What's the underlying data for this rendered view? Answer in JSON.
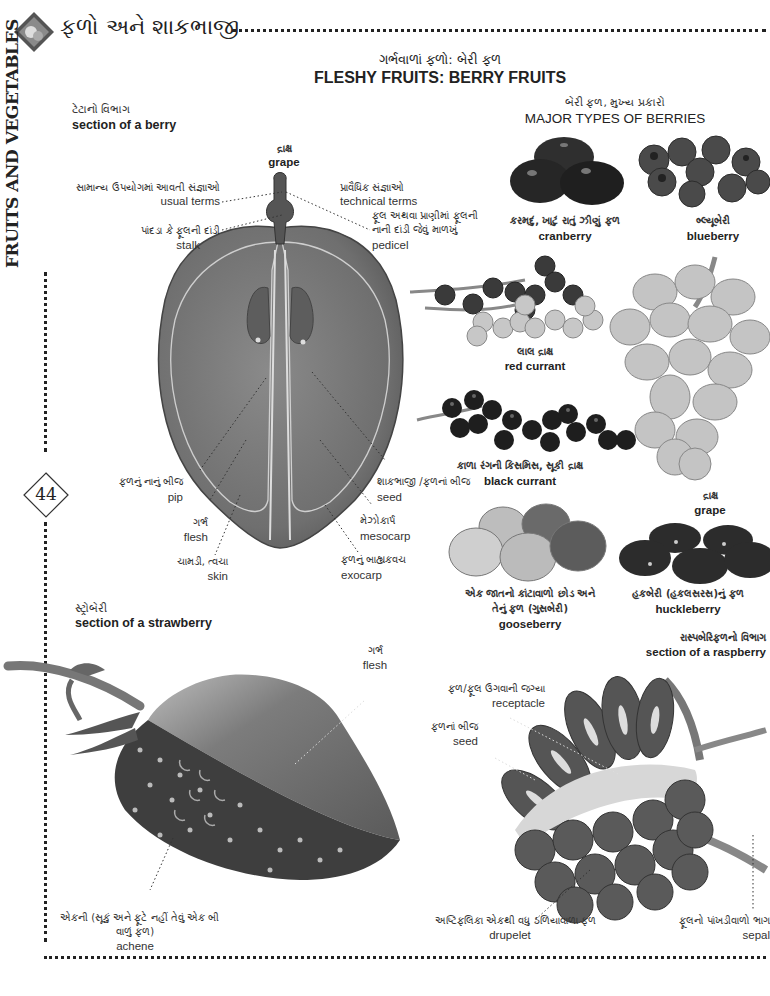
{
  "header": {
    "title_gu": "ફળો અને શાકભાજી",
    "vertical_title": "FRUITS AND VEGETABLES",
    "page_number": "44",
    "heading_gu": "ગર્ભવાળાં ફળો: બેરી ફળ",
    "heading_en": "FLESHY FRUITS: BERRY FRUITS"
  },
  "berry_section": {
    "title_gu": "ટેટાનો વિભાગ",
    "title_en": "section of a berry",
    "fruit_gu": "દ્રાક્ષ",
    "fruit_en": "grape",
    "labels": {
      "usual_gu": "સામાન્ય ઉપયોગમાં આવતી સંજ્ઞાઓ",
      "usual_en": "usual terms",
      "technical_gu": "પ્રાવૈધિક સંજ્ઞાઓ",
      "technical_en": "technical terms",
      "stalk_gu": "પાંદડા કે ફૂલની દાંડી",
      "stalk_en": "stalk",
      "pedicel_gu_1": "ફૂલ અથવા પ્રાણીમાં ફૂલની",
      "pedicel_gu_2": "નાની દાંડી જેવું માળખું",
      "pedicel_en": "pedicel",
      "pip_gu": "ફળનું નાનું બીજ",
      "pip_en": "pip",
      "flesh_gu": "ગર્ભ",
      "flesh_en": "flesh",
      "skin_gu": "ચામડી, ત્વચા",
      "skin_en": "skin",
      "seed_gu": "શાકભાજી /ફળનાં બીજ",
      "seed_en": "seed",
      "mesocarp_gu": "મેઝોકાર્પ",
      "mesocarp_en": "mesocarp",
      "exocarp_gu": "ફળનું બાહ્યકવચ",
      "exocarp_en": "exocarp"
    }
  },
  "major_types": {
    "title_gu": "બેરી ફળ, મુખ્ય પ્રકારો",
    "title_en": "MAJOR TYPES OF BERRIES",
    "items": [
      {
        "gu": "કરમદું, ખાટું રાતું ઝીણું ફળ",
        "en": "cranberry"
      },
      {
        "gu": "બ્લ્યૂબેરી",
        "en": "blueberry"
      },
      {
        "gu": "લાલ દ્રાક્ષ",
        "en": "red currant"
      },
      {
        "gu": "દ્રાક્ષ",
        "en": "grape"
      },
      {
        "gu": "કાળા રંગની કિસમિસ, સૂકી દ્રાક્ષ",
        "en": "black currant"
      },
      {
        "gu_1": "એક જાતનો કાંટાવાળો છોડ અને",
        "gu_2": "તેનું ફળ (ગુસબેરી)",
        "en": "gooseberry"
      },
      {
        "gu": "હકબેરી (હકલસરસ)નું ફળ",
        "en": "huckleberry"
      }
    ]
  },
  "strawberry_section": {
    "title_gu": "સ્ટ્રોબેરી",
    "title_en": "section of a strawberry",
    "flesh_gu": "ગર્ભ",
    "flesh_en": "flesh",
    "achene_gu_1": "એકની (સૂકું અને ફૂટે નહીં તેવું એક બી",
    "achene_gu_2": "વાળું ફળ)",
    "achene_en": "achene"
  },
  "raspberry_section": {
    "title_gu": "રાસ્પબેરિફળનો વિભાગ",
    "title_en": "section of a raspberry",
    "receptacle_gu": "ફળ/ફૂલ ઉગવાની જગ્યા",
    "receptacle_en": "receptacle",
    "seed_gu": "ફળનાં બીજ",
    "seed_en": "seed",
    "drupelet_gu": "અષ્ટિફલિકા એકથી વધુ ઠળિયાવાળા ફળ",
    "drupelet_en": "drupelet",
    "sepal_gu": "ફૂલનો પાંખડીવાળો ભાગ",
    "sepal_en": "sepal"
  },
  "colors": {
    "grape_body": "#6e6e6e",
    "berry_dark": "#2a2a2a",
    "berry_light": "#c9c9c9",
    "raspberry": "#5a5a5a",
    "strawberry_flesh": "#777777",
    "strawberry_skin": "#3c3c3c"
  }
}
